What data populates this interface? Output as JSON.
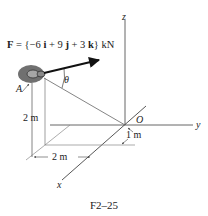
{
  "figure": {
    "caption": "F2–25",
    "force_label": {
      "prefix": "F",
      "equals": " = {",
      "i_coeff": "−6",
      "i": "i",
      "plus1": " + ",
      "j_coeff": "9",
      "j": "j",
      "plus2": " + ",
      "k_coeff": "3",
      "k": "k",
      "suffix": "} kN"
    },
    "force_vector": "F = {−6 i + 9 j + 3 k} kN",
    "axes": {
      "x": "x",
      "y": "y",
      "z": "z",
      "origin": "O"
    },
    "point_label": "A",
    "angle_label": "θ",
    "dimensions": {
      "vertical": "2 m",
      "horizontal": "2 m",
      "offset": "1 m"
    },
    "colors": {
      "line": "#444444",
      "arrow": "#111111",
      "blob": "#6e6e6e",
      "text": "#222222"
    }
  }
}
